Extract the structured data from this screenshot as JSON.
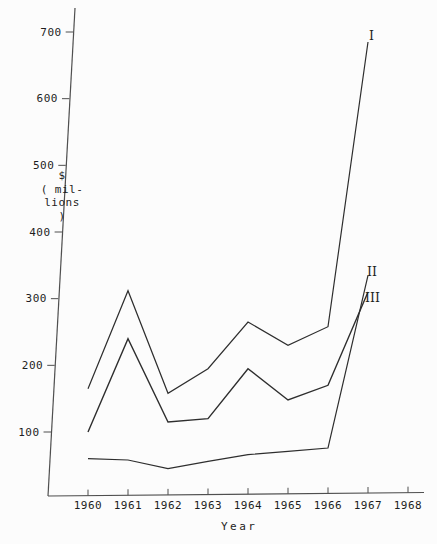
{
  "chart_data": {
    "type": "line",
    "title": "",
    "xlabel": "Year",
    "ylabel_lines": [
      "$",
      "( mil-",
      "lions )"
    ],
    "x_ticks": [
      "1960",
      "1961",
      "1962",
      "1963",
      "1964",
      "1965",
      "1966",
      "1967",
      "1968"
    ],
    "y_ticks": [
      "100",
      "200",
      "300",
      "400",
      "500",
      "600",
      "700"
    ],
    "xlim": [
      1960,
      1968
    ],
    "ylim": [
      0,
      730
    ],
    "grid": false,
    "legend_position": "labels-at-line-ends-right",
    "x": [
      1960,
      1961,
      1962,
      1963,
      1964,
      1965,
      1966,
      1967
    ],
    "series": [
      {
        "name": "I",
        "values": [
          165,
          312,
          158,
          195,
          265,
          230,
          258,
          685
        ]
      },
      {
        "name": "II",
        "values": [
          100,
          240,
          115,
          120,
          195,
          148,
          170,
          310
        ]
      },
      {
        "name": "III",
        "values": [
          60,
          58,
          45,
          56,
          66,
          71,
          76,
          335
        ]
      }
    ],
    "annotations": [
      {
        "text": "I",
        "x": 369,
        "y": 29
      },
      {
        "text": "II",
        "x": 367,
        "y": 265
      },
      {
        "text": "III",
        "x": 365,
        "y": 291
      }
    ],
    "colors": {
      "line": "#2e2e2e",
      "axis": "#4f4f4f",
      "text": "#1e1e1e",
      "background": "#fcfcfc"
    }
  }
}
